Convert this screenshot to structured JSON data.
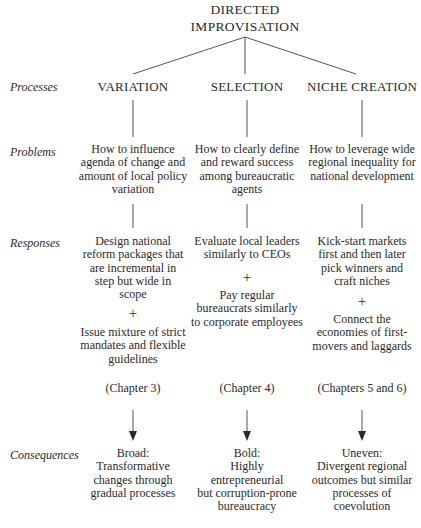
{
  "title": [
    "DIRECTED",
    "IMPROVISATION"
  ],
  "row_labels": {
    "processes": "Processes",
    "problems": "Problems",
    "responses": "Responses",
    "consequences": "Consequences"
  },
  "columns": [
    {
      "process": "VARIATION",
      "problem": [
        "How to influence",
        "agenda of change and",
        "amount of local policy",
        "variation"
      ],
      "response_a": [
        "Design national",
        "reform packages that",
        "are incremental in",
        "step but wide in",
        "scope"
      ],
      "plus": "+",
      "response_b": [
        "Issue mixture of strict",
        "mandates and flexible",
        "guidelines"
      ],
      "chapter": "(Chapter 3)",
      "consequence": [
        "Broad:",
        "Transformative",
        "changes through",
        "gradual processes"
      ]
    },
    {
      "process": "SELECTION",
      "problem": [
        "How to clearly define",
        "and reward success",
        "among bureaucratic",
        "agents"
      ],
      "response_a": [
        "Evaluate local leaders",
        "similarly to CEOs"
      ],
      "plus": "+",
      "response_b": [
        "Pay regular",
        "bureaucrats similarly",
        "to corporate employees"
      ],
      "chapter": "(Chapter 4)",
      "consequence": [
        "Bold:",
        "Highly",
        "entrepreneurial",
        "but corruption-prone",
        "bureaucracy"
      ]
    },
    {
      "process": "NICHE CREATION",
      "problem": [
        "How to leverage wide",
        "regional inequality for",
        "national development"
      ],
      "response_a": [
        "Kick-start markets",
        "first and then later",
        "pick winners and",
        "craft niches"
      ],
      "plus": "+",
      "response_b": [
        "Connect the",
        "economies of first-",
        "movers and laggards"
      ],
      "chapter": "(Chapters 5 and 6)",
      "consequence": [
        "Uneven:",
        "Divergent regional",
        "outcomes but similar",
        "processes of",
        "coevolution"
      ]
    }
  ],
  "colors": {
    "text": "#2a2a2a",
    "line": "#555555",
    "background": "#ffffff"
  }
}
